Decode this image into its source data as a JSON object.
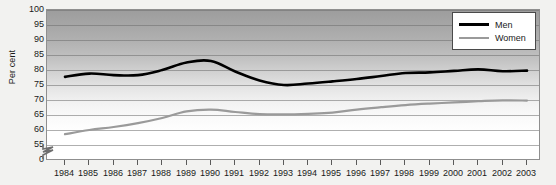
{
  "chart_data": {
    "type": "line",
    "title": "",
    "xlabel": "",
    "ylabel": "Per cent",
    "ylim": [
      53,
      100
    ],
    "yticks": [
      100,
      95,
      90,
      85,
      80,
      75,
      70,
      65,
      60,
      55,
      0
    ],
    "axis_break": true,
    "grid": true,
    "legend_position": "top-right",
    "categories": [
      "1984",
      "1985",
      "1986",
      "1987",
      "1988",
      "1989",
      "1990",
      "1991",
      "1992",
      "1993",
      "1994",
      "1995",
      "1996",
      "1997",
      "1998",
      "1999",
      "2000",
      "2001",
      "2002",
      "2003"
    ],
    "series": [
      {
        "name": "Men",
        "color": "#000000",
        "values": [
          77.7,
          78.8,
          78.3,
          78.3,
          80.0,
          82.5,
          83.0,
          79.5,
          76.5,
          75.0,
          75.5,
          76.2,
          77.0,
          78.0,
          79.0,
          79.2,
          79.7,
          80.2,
          79.6,
          79.8
        ]
      },
      {
        "name": "Women",
        "color": "#9a9a9a",
        "values": [
          58.6,
          60.0,
          61.0,
          62.3,
          64.0,
          66.2,
          66.8,
          66.0,
          65.3,
          65.2,
          65.4,
          65.8,
          66.8,
          67.6,
          68.3,
          68.8,
          69.2,
          69.6,
          69.9,
          69.8
        ]
      }
    ]
  },
  "legend": {
    "items": [
      {
        "label": "Men"
      },
      {
        "label": "Women"
      }
    ]
  }
}
